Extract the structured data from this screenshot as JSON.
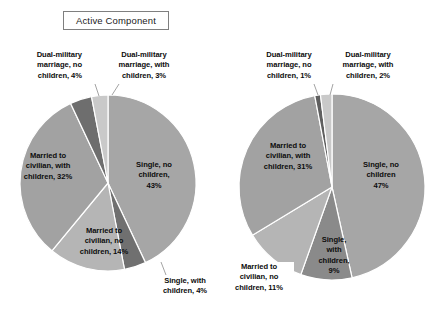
{
  "chart_data": [
    {
      "type": "pie",
      "title": "Active Component",
      "categories": [
        "Single, no children",
        "Single, with children",
        "Married to civilian, no children",
        "Married to civilian, with children",
        "Dual-military marriage, no children",
        "Dual-military marriage, with children"
      ],
      "values": [
        43,
        4,
        14,
        32,
        4,
        3
      ],
      "value_unit": "%",
      "labels": [
        "Single, no children, 43%",
        "Single, with children, 4%",
        "Married to civilian, no children, 14%",
        "Married to civilian, with children, 32%",
        "Dual-military marriage, no children, 4%",
        "Dual-military marriage, with children, 3%"
      ],
      "colors": [
        "#a6a6a6",
        "#707070",
        "#b5b5b5",
        "#a2a2a2",
        "#6e6e6e",
        "#c9c9c9"
      ],
      "legend": "none",
      "start_angle_deg": 0,
      "direction": "clockwise"
    },
    {
      "type": "pie",
      "title": "Reserve Component",
      "categories": [
        "Single, no children",
        "Single, with children",
        "Married to civilian, no children",
        "Married to civilian, with children",
        "Dual-military marriage, no children",
        "Dual-military marriage, with children"
      ],
      "values": [
        47,
        9,
        11,
        31,
        1,
        2
      ],
      "value_unit": "%",
      "labels": [
        "Single, no children 47%",
        "Single, with children, 9%",
        "Married to civilian, no children, 11%",
        "Married to civilian, with children, 31%",
        "Dual-military marriage, no children, 1%",
        "Dual-military marriage, with children, 2%"
      ],
      "colors": [
        "#a6a6a6",
        "#8a8a8a",
        "#b5b5b5",
        "#a2a2a2",
        "#5f5f5f",
        "#c9c9c9"
      ],
      "legend": "none",
      "start_angle_deg": 0,
      "direction": "clockwise"
    }
  ],
  "active": {
    "title": "Active Component",
    "labels": {
      "single_no_children": "Single, no\nchildren,\n43%",
      "single_no_children_l1": "Single, no",
      "single_no_children_l2": "children,",
      "single_no_children_l3": "43%",
      "single_with_children_l1": "Single, with",
      "single_with_children_l2": "children, 4%",
      "married_civ_no_children_l1": "Married to",
      "married_civ_no_children_l2": "civilian, no",
      "married_civ_no_children_l3": "children, 14%",
      "married_civ_with_children_l1": "Married to",
      "married_civ_with_children_l2": "civilian, with",
      "married_civ_with_children_l3": "children, 32%",
      "dual_no_children_l1": "Dual-military",
      "dual_no_children_l2": "marriage, no",
      "dual_no_children_l3": "children, 4%",
      "dual_with_children_l1": "Dual-military",
      "dual_with_children_l2": "marriage, with",
      "dual_with_children_l3": "children, 3%"
    }
  },
  "reserve": {
    "title": "Reserve Component",
    "labels": {
      "single_no_children_l1": "Single, no",
      "single_no_children_l2": "children",
      "single_no_children_l3": "47%",
      "single_with_children_l1": "Single,",
      "single_with_children_l2": "with",
      "single_with_children_l3": "children,",
      "single_with_children_l4": "9%",
      "married_civ_no_children_l1": "Married to",
      "married_civ_no_children_l2": "civilian, no",
      "married_civ_no_children_l3": "children, 11%",
      "married_civ_with_children_l1": "Married to",
      "married_civ_with_children_l2": "civilian, with",
      "married_civ_with_children_l3": "children, 31%",
      "dual_no_children_l1": "Dual-military",
      "dual_no_children_l2": "marriage, no",
      "dual_no_children_l3": "children, 1%",
      "dual_with_children_l1": "Dual-military",
      "dual_with_children_l2": "marriage, with",
      "dual_with_children_l3": "children, 2%"
    }
  }
}
